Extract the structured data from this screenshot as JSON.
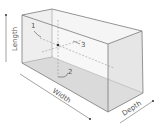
{
  "diagram": {
    "axes": {
      "length": "Length",
      "width": "Width",
      "depth": "Depth"
    },
    "callouts": [
      "1",
      "2",
      "3"
    ],
    "colors": {
      "edge": "#7a7a7a",
      "face_top": "#ececec",
      "face_side": "#e2e2e2",
      "face_bottom": "#cfcfcf",
      "dashed": "#9a9a9a",
      "text": "#555555"
    }
  }
}
